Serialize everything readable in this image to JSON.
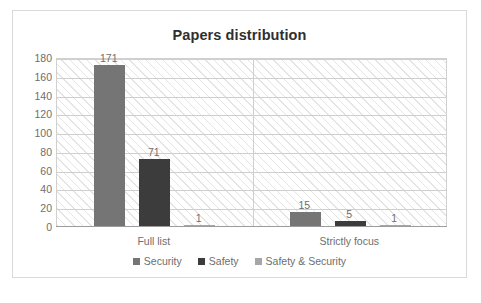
{
  "chart_data": {
    "type": "bar",
    "title": "Papers distribution",
    "xlabel": "",
    "ylabel": "",
    "categories": [
      "Full list",
      "Strictly focus"
    ],
    "series": [
      {
        "name": "Security",
        "color": "#757575",
        "values": [
          171,
          15
        ]
      },
      {
        "name": "Safety",
        "color": "#3c3c3c",
        "values": [
          71,
          5
        ]
      },
      {
        "name": "Safety & Security",
        "color": "#a6a6a6",
        "values": [
          1,
          1
        ]
      }
    ],
    "ylim": [
      0,
      180
    ],
    "yticks": [
      0,
      20,
      40,
      60,
      80,
      100,
      120,
      140,
      160,
      180
    ],
    "ytick_labels": [
      "0",
      "20",
      "40",
      "60",
      "80",
      "100",
      "120",
      "140",
      "160",
      "180"
    ],
    "grid": true,
    "grid_orientation": "horizontal",
    "plot_background": "diagonal-hatch",
    "legend_position": "bottom",
    "data_labels": [
      {
        "series": "Security",
        "category": "Full list",
        "value": 171,
        "text": "171"
      },
      {
        "series": "Safety",
        "category": "Full list",
        "value": 71,
        "text": "71"
      },
      {
        "series": "Safety & Security",
        "category": "Full list",
        "value": 1,
        "text": "1"
      },
      {
        "series": "Security",
        "category": "Strictly focus",
        "value": 15,
        "text": "15"
      },
      {
        "series": "Safety",
        "category": "Strictly focus",
        "value": 5,
        "text": "5"
      },
      {
        "series": "Safety & Security",
        "category": "Strictly focus",
        "value": 1,
        "text": "1"
      }
    ]
  },
  "chart": {
    "title": "Papers distribution"
  },
  "axis": {
    "y_labels": [
      "180",
      "160",
      "140",
      "120",
      "100",
      "80",
      "60",
      "40",
      "20",
      "0"
    ],
    "x_labels": [
      "Full list",
      "Strictly focus"
    ]
  },
  "legend": {
    "items": [
      {
        "label": "Security",
        "color": "#757575"
      },
      {
        "label": "Safety",
        "color": "#3c3c3c"
      },
      {
        "label": "Safety & Security",
        "color": "#a6a6a6"
      }
    ]
  },
  "labels": {
    "b1": "171",
    "b2": "71",
    "b3": "1",
    "b4": "15",
    "b5": "5",
    "b6": "1"
  }
}
